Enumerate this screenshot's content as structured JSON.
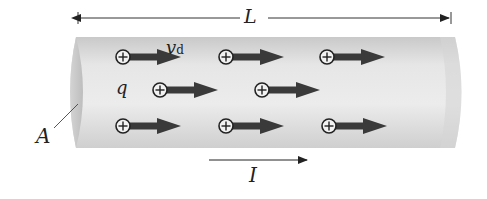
{
  "figure": {
    "type": "conducting wire with drifting positive charges",
    "labels": {
      "length": "L",
      "drift_velocity": "v",
      "drift_velocity_sub": "d",
      "charge": "q",
      "area": "A",
      "current": "I"
    },
    "charges": [
      {
        "row": 1,
        "x": 123,
        "y": 57
      },
      {
        "row": 1,
        "x": 226,
        "y": 57
      },
      {
        "row": 1,
        "x": 327,
        "y": 57
      },
      {
        "row": 2,
        "x": 160,
        "y": 90
      },
      {
        "row": 2,
        "x": 262,
        "y": 90
      },
      {
        "row": 3,
        "x": 123,
        "y": 126
      },
      {
        "row": 3,
        "x": 226,
        "y": 126
      },
      {
        "row": 3,
        "x": 329,
        "y": 126
      }
    ],
    "colors": {
      "arrow": "#3a3a3a",
      "cylinder_light": "#ececec",
      "cylinder_dark": "#c2c2c2",
      "line": "#333333"
    }
  }
}
